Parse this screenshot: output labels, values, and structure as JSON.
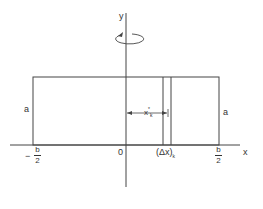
{
  "figure": {
    "axes": {
      "x_label": "x",
      "y_label": "y",
      "origin_label": "0"
    },
    "labels": {
      "left_height": "a",
      "right_height": "a",
      "left_minus": "−",
      "frac_num": "b",
      "frac_den": "2",
      "xk_star": "x",
      "xk_sub": "k",
      "xk_sup": "*",
      "delta_x": "(Δx)",
      "delta_sub": "k"
    },
    "rotation_icon": "rotation-arrow-icon"
  }
}
